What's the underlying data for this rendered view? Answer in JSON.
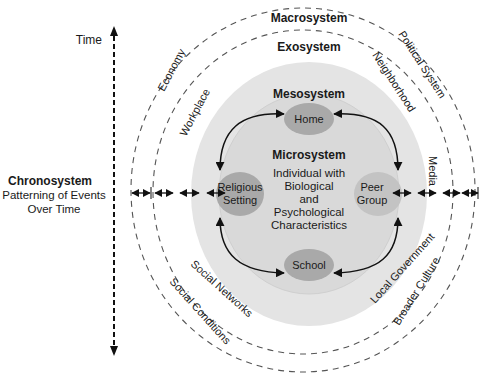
{
  "diagram": {
    "time_axis": {
      "label": "Time"
    },
    "chronosystem": {
      "title": "Chronosystem",
      "line1": "Patterning of Events",
      "line2": "Over Time"
    },
    "macrosystem": {
      "title": "Macrosystem",
      "items": [
        "Economy",
        "Political System",
        "Social Conditions",
        "Broader Culture"
      ]
    },
    "exosystem": {
      "title": "Exosystem",
      "items": [
        "Workplace",
        "Neighborhood",
        "Media",
        "Social Networks",
        "Local Government"
      ]
    },
    "mesosystem": {
      "title": "Mesosystem"
    },
    "microsystem": {
      "title": "Microsystem",
      "center": [
        "Individual with",
        "Biological",
        "and",
        "Psychological",
        "Characteristics"
      ],
      "settings": {
        "home": "Home",
        "school": "School",
        "religious": [
          "Religious",
          "Setting"
        ],
        "peer": [
          "Peer",
          "Group"
        ]
      }
    },
    "colors": {
      "mesosystem_fill": "#e4e4e4",
      "microsystem_fill": "#d6d6d6",
      "setting_fill": "#a9a9a9",
      "line": "#111111",
      "dash": "#555555"
    }
  }
}
